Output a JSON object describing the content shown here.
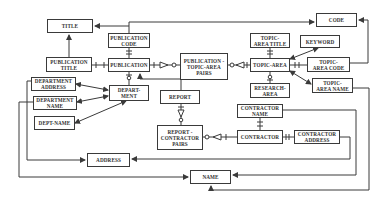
{
  "diagram": {
    "type": "entity-relationship",
    "entities": [
      {
        "id": "title",
        "label": "TITLE",
        "x": 47,
        "y": 19,
        "w": 46,
        "h": 14
      },
      {
        "id": "publication_code",
        "label": "PUBLICATION\nCODE",
        "x": 108,
        "y": 33,
        "w": 42,
        "h": 15
      },
      {
        "id": "publication_title",
        "label": "PUBLICATION\nTITLE",
        "x": 46,
        "y": 57,
        "w": 46,
        "h": 15
      },
      {
        "id": "publication",
        "label": "PUBLICATION",
        "x": 108,
        "y": 58,
        "w": 42,
        "h": 14
      },
      {
        "id": "publication_topic_area_pairs",
        "label": "PUBLICATION -\nTOPIC-AREA\nPAIRS",
        "x": 180,
        "y": 53,
        "w": 48,
        "h": 27
      },
      {
        "id": "code",
        "label": "CODE",
        "x": 316,
        "y": 13,
        "w": 41,
        "h": 14
      },
      {
        "id": "topic_area_title",
        "label": "TOPIC-\nAREA TITLE",
        "x": 250,
        "y": 33,
        "w": 40,
        "h": 15
      },
      {
        "id": "keyword",
        "label": "KEYWORD",
        "x": 300,
        "y": 35,
        "w": 40,
        "h": 13
      },
      {
        "id": "topic_area",
        "label": "TOPIC-AREA",
        "x": 250,
        "y": 58,
        "w": 40,
        "h": 14
      },
      {
        "id": "topic_area_code",
        "label": "TOPIC-\nAREA CODE",
        "x": 307,
        "y": 57,
        "w": 43,
        "h": 15
      },
      {
        "id": "research_area",
        "label": "RESEARCH-\nAREA",
        "x": 250,
        "y": 83,
        "w": 40,
        "h": 15
      },
      {
        "id": "topic_area_name",
        "label": "TOPIC-\nAREA NAME",
        "x": 312,
        "y": 78,
        "w": 41,
        "h": 15
      },
      {
        "id": "department_address",
        "label": "DEPARTMENT\nADDRESS",
        "x": 31,
        "y": 77,
        "w": 45,
        "h": 14
      },
      {
        "id": "department_name",
        "label": "DEPARTMENT\nNAME",
        "x": 33,
        "y": 96,
        "w": 44,
        "h": 14
      },
      {
        "id": "dept_name",
        "label": "DEPT-NAME",
        "x": 34,
        "y": 116,
        "w": 41,
        "h": 14
      },
      {
        "id": "department",
        "label": "DEPART-\nMENT",
        "x": 109,
        "y": 85,
        "w": 40,
        "h": 16
      },
      {
        "id": "report",
        "label": "REPORT",
        "x": 160,
        "y": 90,
        "w": 40,
        "h": 14
      },
      {
        "id": "report_contractor_pairs",
        "label": "REPORT -\nCONTRACTOR\nPAIRS",
        "x": 157,
        "y": 125,
        "w": 46,
        "h": 25
      },
      {
        "id": "contractor_name",
        "label": "CONTRACTOR\nNAME",
        "x": 237,
        "y": 104,
        "w": 46,
        "h": 14
      },
      {
        "id": "contractor",
        "label": "CONTRACTOR",
        "x": 237,
        "y": 130,
        "w": 46,
        "h": 14
      },
      {
        "id": "contractor_address",
        "label": "CONTRACTOR\nADDRESS",
        "x": 294,
        "y": 130,
        "w": 46,
        "h": 14
      },
      {
        "id": "address",
        "label": "ADDRESS",
        "x": 87,
        "y": 153,
        "w": 43,
        "h": 14
      },
      {
        "id": "name",
        "label": "NAME",
        "x": 190,
        "y": 170,
        "w": 41,
        "h": 14
      }
    ],
    "colors": {
      "line": "#3a3a3a",
      "text": "#333333",
      "background": "#ffffff"
    }
  }
}
